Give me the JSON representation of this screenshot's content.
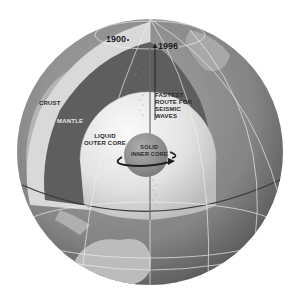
{
  "diagram": {
    "labels": {
      "crust": "CRUST",
      "mantle": "MANTLE",
      "outer_core": "LIQUID\nOUTER CORE",
      "inner_core": "SOLID\nINNER CORE",
      "fastest_route": "FASTEST\nROUTE FOR\nSEISMIC\nWAVES",
      "year_1900": "1900",
      "year_1996": "1996"
    },
    "colors": {
      "background": "#ffffff",
      "ocean": "#8a8a8a",
      "land": "#b8b8b8",
      "crust_cut": "#d8d8d8",
      "mantle": "#5e5e5e",
      "outer_core": "#e6e6e6",
      "inner_core": "#9a9a9a",
      "grid_lines": "#f0f0f0",
      "text": "#2a2a2a"
    },
    "icons": {
      "rotation_arrow": "curved-arrow-icon",
      "direction_arrow": "arrow-up-icon"
    }
  }
}
